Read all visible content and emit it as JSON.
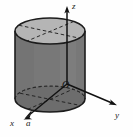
{
  "figure": {
    "background_color": "#fefefe",
    "width": 133,
    "height": 137
  },
  "labels": {
    "z_axis": "z",
    "y_axis": "y",
    "x_axis": "x",
    "radius_mark": "a",
    "origin": "O"
  },
  "colors": {
    "top_face_fill": "#b5b5b5",
    "body_fill": "#787878",
    "bottom_face_fill": "#6d6d6d",
    "outline": "#1c1c1c",
    "dashed_line": "#2a2a2a",
    "axis_line": "#111111",
    "label_text": "#1a1a1a"
  },
  "geometry": {
    "cylinder": {
      "center_x": 50,
      "top_ellipse_cy": 31,
      "bottom_ellipse_cy": 99,
      "rx": 35,
      "ry": 13,
      "left_edge_x": 15,
      "right_edge_x": 85,
      "height_px": 68
    },
    "origin": {
      "x": 67,
      "y": 84
    },
    "z_axis_tip": {
      "x": 67,
      "y": 7
    },
    "y_axis_tip": {
      "x": 117,
      "y": 105
    },
    "x_axis_tip": {
      "x": 24,
      "y": 119
    },
    "radius_tick": {
      "x": 30,
      "y": 113
    }
  },
  "annotations": {
    "dashed_chords_top": 2,
    "dashed_chords_bottom": 2,
    "arrowheads": [
      "z",
      "y",
      "x"
    ]
  }
}
